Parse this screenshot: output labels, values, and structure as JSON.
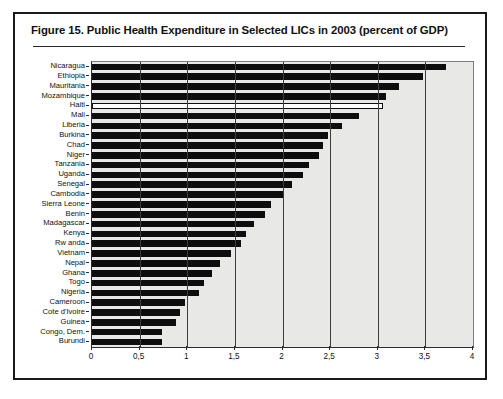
{
  "figure": {
    "title": "Figure 15.  Public Health Expenditure in Selected LICs in 2003 (percent of GDP)"
  },
  "chart_data": {
    "type": "bar",
    "orientation": "horizontal",
    "title": "Figure 15.  Public Health Expenditure in Selected LICs in 2003 (percent of GDP)",
    "xlabel": "",
    "ylabel": "",
    "xlim": [
      0,
      4
    ],
    "xticks": [
      0,
      0.5,
      1,
      1.5,
      2,
      2.5,
      3,
      3.5,
      4
    ],
    "xtick_labels": [
      "0",
      "0,5",
      "1",
      "1,5",
      "2",
      "2,5",
      "3",
      "3,5",
      "4"
    ],
    "grid": true,
    "grid_axis": "x",
    "legend": false,
    "bar_color": "#0d0d0d",
    "highlight_color": "#ffffff",
    "plot_background": "#e8e8e6",
    "categories": [
      "Nicaragua",
      "Ethiopia",
      "Mauritania",
      "Mozambique",
      "Haiti",
      "Mali",
      "Liberia",
      "Burkina",
      "Chad",
      "Niger",
      "Tanzania",
      "Uganda",
      "Senegal",
      "Cambodia",
      "Sierra Leone",
      "Benin",
      "Madagascar",
      "Kenya",
      "Rw anda",
      "Vietnam",
      "Nepal",
      "Ghana",
      "Togo",
      "Nigeria",
      "Cameroon",
      "Cote d'Ivoire",
      "Guinea",
      "Congo, Dem.",
      "Burundi"
    ],
    "values": [
      3.72,
      3.48,
      3.22,
      3.09,
      3.05,
      2.8,
      2.62,
      2.48,
      2.43,
      2.38,
      2.28,
      2.22,
      2.1,
      2.0,
      1.88,
      1.82,
      1.7,
      1.62,
      1.56,
      1.46,
      1.34,
      1.26,
      1.18,
      1.12,
      0.98,
      0.92,
      0.88,
      0.74,
      0.73
    ],
    "highlighted": [
      "Haiti"
    ]
  }
}
